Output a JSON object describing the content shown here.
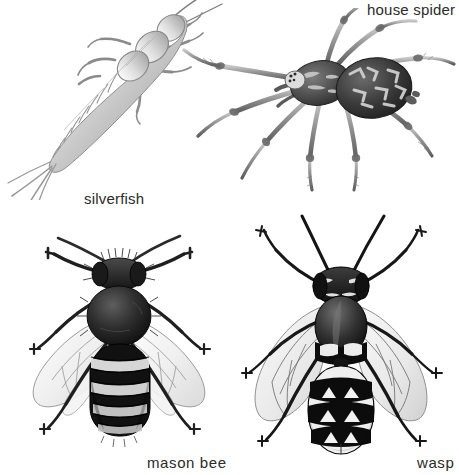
{
  "plate": {
    "title": "Household arthropods identification plate",
    "background_color": "#ffffff",
    "ink_color": "#2b2b2b",
    "width": 459,
    "height": 475,
    "medium": "graphite pencil illustration",
    "figure_count": 4
  },
  "figures": [
    {
      "id": "silverfish",
      "label": "silverfish",
      "common_name": "silverfish",
      "group": "insect",
      "orientation": "diagonal, head upper-right, tail lower-left",
      "tone": "pale silvery grey, segmented",
      "legs": 6,
      "antennae": 2,
      "tail_bristles": 3,
      "position": "top-left"
    },
    {
      "id": "house-spider",
      "label": "house spider",
      "common_name": "house spider",
      "group": "arachnid",
      "orientation": "dorsal view, facing left",
      "tone": "dark abdomen with pale chevron markings",
      "legs": 8,
      "antennae": 0,
      "position": "top-right"
    },
    {
      "id": "mason-bee",
      "label": "mason bee",
      "common_name": "mason bee",
      "group": "insect",
      "orientation": "dorsal view, head up",
      "tone": "dark furry body, banded abdomen",
      "legs": 6,
      "antennae": 2,
      "wings": 4,
      "abdomen_bands": 5,
      "position": "bottom-left"
    },
    {
      "id": "wasp",
      "label": "wasp",
      "common_name": "wasp",
      "group": "insect",
      "orientation": "dorsal view, head up",
      "tone": "bold black and white banded abdomen",
      "legs": 6,
      "antennae": 2,
      "wings": 4,
      "abdomen_bands": 5,
      "position": "bottom-right"
    }
  ],
  "labels": {
    "silverfish": "silverfish",
    "house_spider": "house spider",
    "mason_bee": "mason bee",
    "wasp": "wasp"
  }
}
